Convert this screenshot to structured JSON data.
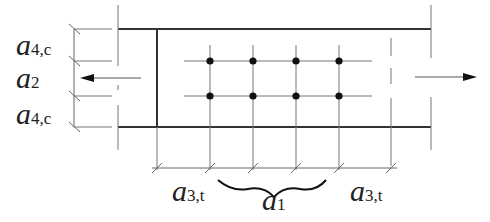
{
  "diagram": {
    "type": "fastener-spacing-detail",
    "colors": {
      "line": "#555555",
      "thick_line": "#333333",
      "dot": "#111111",
      "text": "#222222"
    },
    "labels": {
      "a4c_top": {
        "main": "a",
        "sub": "4,c"
      },
      "a2": {
        "main": "a",
        "sub": "2"
      },
      "a4c_bottom": {
        "main": "a",
        "sub": "4,c"
      },
      "a3t_left": {
        "main": "a",
        "sub": "3,t"
      },
      "a1": {
        "main": "a",
        "sub": "1"
      },
      "a3t_right": {
        "main": "a",
        "sub": "3,t"
      }
    },
    "fastener_grid": {
      "rows": 2,
      "columns": 4,
      "x": [
        210,
        253,
        296,
        339
      ],
      "y": [
        61,
        96
      ]
    },
    "arrows": [
      {
        "direction": "left",
        "meaning": "tension-force"
      },
      {
        "direction": "right",
        "meaning": "tension-force"
      }
    ]
  }
}
